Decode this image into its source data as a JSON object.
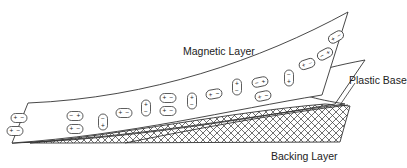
{
  "diagram": {
    "labels": {
      "magnetic_layer": "Magnetic Layer",
      "plastic_base": "Plastic Base",
      "backing_layer": "Backing Layer"
    },
    "particle_signs": {
      "plus": "+",
      "minus": "−"
    },
    "particles": [
      {
        "x": 19,
        "y": 118,
        "orient": "h",
        "left": "+",
        "right": "−"
      },
      {
        "x": 15,
        "y": 131,
        "orient": "h",
        "left": "+",
        "right": "−"
      },
      {
        "x": 75,
        "y": 116,
        "orient": "h",
        "left": "−",
        "right": "+"
      },
      {
        "x": 75,
        "y": 129,
        "orient": "h",
        "left": "+",
        "right": "−"
      },
      {
        "x": 103,
        "y": 122,
        "orient": "v",
        "top": "−",
        "bottom": "+"
      },
      {
        "x": 124,
        "y": 113,
        "orient": "h",
        "left": "+",
        "right": "−"
      },
      {
        "x": 146,
        "y": 108,
        "orient": "v",
        "top": "+",
        "bottom": "−"
      },
      {
        "x": 168,
        "y": 98,
        "orient": "h",
        "left": "+",
        "right": "−"
      },
      {
        "x": 168,
        "y": 111,
        "orient": "h",
        "left": "+",
        "right": "−"
      },
      {
        "x": 192,
        "y": 101,
        "orient": "v",
        "top": "+",
        "bottom": "−"
      },
      {
        "x": 214,
        "y": 94,
        "orient": "h",
        "left": "+",
        "right": "−",
        "rot": -10
      },
      {
        "x": 237,
        "y": 87,
        "orient": "v",
        "top": "+",
        "bottom": "−"
      },
      {
        "x": 260,
        "y": 82,
        "orient": "h",
        "left": "−",
        "right": "+",
        "rot": -12
      },
      {
        "x": 263,
        "y": 96,
        "orient": "h",
        "left": "+",
        "right": "−",
        "rot": -12
      },
      {
        "x": 289,
        "y": 78,
        "orient": "v",
        "top": "−",
        "bottom": "+"
      },
      {
        "x": 307,
        "y": 64,
        "orient": "h",
        "left": "+",
        "right": "−",
        "rot": -18
      },
      {
        "x": 325,
        "y": 54,
        "orient": "h",
        "left": "−",
        "right": "+",
        "rot": -28
      },
      {
        "x": 336,
        "y": 37,
        "orient": "h",
        "left": "+",
        "right": "−",
        "rot": -30
      }
    ]
  }
}
